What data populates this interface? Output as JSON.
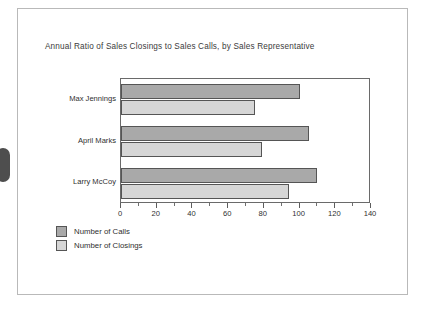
{
  "page": {
    "artifact_name": "scan-binding-mark"
  },
  "chart_data": {
    "type": "bar",
    "orientation": "horizontal",
    "title": "Annual Ratio of Sales Closings to Sales Calls, by Sales Representative",
    "xlabel": "",
    "ylabel": "",
    "xlim": [
      0,
      140
    ],
    "xticks": [
      0,
      20,
      40,
      60,
      80,
      100,
      120,
      140
    ],
    "xtick_labels": [
      "0",
      "20",
      "40",
      "60",
      "80",
      "100",
      "120",
      "140"
    ],
    "minor_tick_interval": 10,
    "grid": false,
    "legend_position": "below-left",
    "categories": [
      "Max Jennings",
      "April Marks",
      "Larry McCoy"
    ],
    "series": [
      {
        "name": "Number of Calls",
        "color": "#a9a9a9",
        "values": [
          100,
          105,
          110
        ]
      },
      {
        "name": "Number of Closings",
        "color": "#d6d6d6",
        "values": [
          75,
          79,
          94
        ]
      }
    ]
  }
}
